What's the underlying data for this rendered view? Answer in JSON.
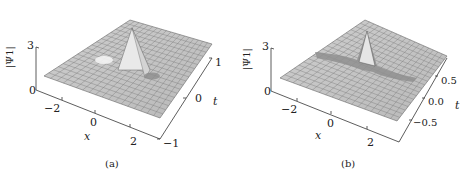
{
  "figure": {
    "panels": [
      {
        "id": "a",
        "caption": "(a)",
        "zlabel": "|Ψ1|",
        "xlabel": "x",
        "ylabel": "t",
        "z_ticks": [
          "0",
          "3"
        ],
        "x_ticks": [
          "−2",
          "0",
          "2"
        ],
        "t_ticks": [
          "−1",
          "0",
          "1"
        ]
      },
      {
        "id": "b",
        "caption": "(b)",
        "zlabel": "|Ψ1|",
        "xlabel": "x",
        "ylabel": "t",
        "z_ticks": [
          "0",
          "3"
        ],
        "x_ticks": [
          "−2",
          "0",
          "2"
        ],
        "t_ticks": [
          "−0.5",
          "0.0",
          "0.5"
        ]
      }
    ]
  },
  "chart_data": [
    {
      "type": "surface",
      "title": "(a)",
      "xlabel": "x",
      "ylabel": "t",
      "zlabel": "|Ψ1|",
      "xlim": [
        -3,
        3
      ],
      "ylim": [
        -1,
        1
      ],
      "zlim": [
        0,
        3
      ],
      "x_ticks": [
        -2,
        0,
        2
      ],
      "y_ticks": [
        -1,
        0,
        1
      ],
      "z_ticks": [
        0,
        3
      ],
      "description": "Localized peak near x≈0, t≈0 reaching ~3 with two adjacent dips on a background level ~1"
    },
    {
      "type": "surface",
      "title": "(b)",
      "xlabel": "x",
      "ylabel": "t",
      "zlabel": "|Ψ1|",
      "xlim": [
        -3,
        3
      ],
      "ylim": [
        -0.8,
        0.8
      ],
      "zlim": [
        0,
        3
      ],
      "x_ticks": [
        -2,
        0,
        2
      ],
      "y_ticks": [
        -0.5,
        0.0,
        0.5
      ],
      "z_ticks": [
        0,
        3
      ],
      "description": "Sharp narrow peak near x≈0, t≈0 reaching ~3 with elongated trough along one diagonal on background ~1"
    }
  ]
}
